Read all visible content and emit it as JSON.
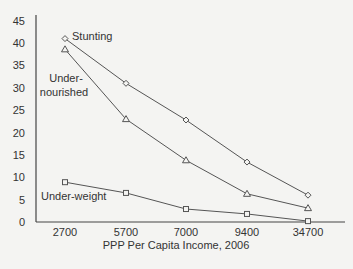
{
  "chart_data": {
    "type": "line",
    "title": "",
    "xlabel": "PPP Per Capita Income, 2006",
    "ylabel": "",
    "categories": [
      "2700",
      "5700",
      "7000",
      "9400",
      "34700"
    ],
    "ylim": [
      0,
      45
    ],
    "yticks": [
      0,
      5,
      10,
      15,
      20,
      25,
      30,
      35,
      40,
      45
    ],
    "grid": false,
    "legend_position": "inline labels",
    "series": [
      {
        "name": "Stunting",
        "marker": "diamond",
        "values": [
          41,
          31,
          22.8,
          13.4,
          6.0
        ]
      },
      {
        "name": "Under-nourished",
        "marker": "triangle",
        "values": [
          38.6,
          23,
          13.8,
          6.3,
          3.1
        ]
      },
      {
        "name": "Under-weight",
        "marker": "square",
        "values": [
          8.9,
          6.5,
          2.9,
          1.8,
          0.2
        ]
      }
    ],
    "annotations": [
      {
        "text": "Stunting",
        "series": "Stunting"
      },
      {
        "text": "Under-",
        "series": "Under-nourished"
      },
      {
        "text": "nourished",
        "series": "Under-nourished"
      },
      {
        "text": "Under-weight",
        "series": "Under-weight"
      }
    ],
    "colors": {
      "line": "#555555",
      "axis": "#444444",
      "background": "#f4f4f2"
    }
  }
}
